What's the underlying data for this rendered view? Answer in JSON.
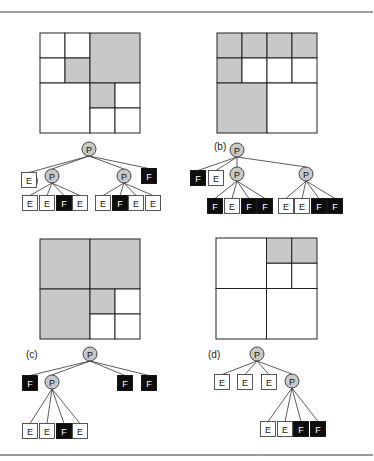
{
  "figure": {
    "rules": [
      {
        "x1": 0,
        "y1": 12,
        "x2": 373,
        "y2": 12
      },
      {
        "x1": 0,
        "y1": 455,
        "x2": 373,
        "y2": 455
      }
    ],
    "colors": {
      "gray_fill": "#c8c8c8",
      "full_fill": "#0d0d0d",
      "empty_fill": "#ffffff",
      "line": "#222222"
    },
    "panels": [
      {
        "id": "a",
        "label": "(a)",
        "label_pos": [
          26,
          184
        ],
        "grid": {
          "x": 40,
          "y": 33,
          "size": 100
        },
        "cells": [
          {
            "x": 0,
            "y": 0,
            "s": 0.25,
            "fill": "empty"
          },
          {
            "x": 0.25,
            "y": 0,
            "s": 0.25,
            "fill": "empty"
          },
          {
            "x": 0,
            "y": 0.25,
            "s": 0.25,
            "fill": "empty"
          },
          {
            "x": 0.25,
            "y": 0.25,
            "s": 0.25,
            "fill": "full"
          },
          {
            "x": 0.5,
            "y": 0,
            "s": 0.5,
            "fill": "full"
          },
          {
            "x": 0,
            "y": 0.5,
            "s": 0.5,
            "fill": "empty"
          },
          {
            "x": 0.5,
            "y": 0.5,
            "s": 0.25,
            "fill": "full"
          },
          {
            "x": 0.75,
            "y": 0.5,
            "s": 0.25,
            "fill": "empty"
          },
          {
            "x": 0.5,
            "y": 0.75,
            "s": 0.25,
            "fill": "empty"
          },
          {
            "x": 0.75,
            "y": 0.75,
            "s": 0.25,
            "fill": "empty"
          }
        ],
        "tree": {
          "label": "P",
          "x": 89,
          "y": 149,
          "children": [
            {
              "label": "E",
              "x": 29,
              "y": 180
            },
            {
              "label": "P",
              "x": 52,
              "y": 176,
              "children": [
                {
                  "label": "E",
                  "x": 30,
                  "y": 203
                },
                {
                  "label": "E",
                  "x": 47,
                  "y": 203
                },
                {
                  "label": "F",
                  "x": 64,
                  "y": 203
                },
                {
                  "label": "E",
                  "x": 80,
                  "y": 203
                }
              ]
            },
            {
              "label": "P",
              "x": 124,
              "y": 176,
              "children": [
                {
                  "label": "E",
                  "x": 103,
                  "y": 203
                },
                {
                  "label": "F",
                  "x": 120,
                  "y": 203
                },
                {
                  "label": "E",
                  "x": 136,
                  "y": 203
                },
                {
                  "label": "E",
                  "x": 153,
                  "y": 203
                }
              ]
            },
            {
              "label": "F",
              "x": 149,
              "y": 176
            }
          ]
        }
      },
      {
        "id": "b",
        "label": "(b)",
        "label_pos": [
          214,
          150
        ],
        "grid": {
          "x": 217,
          "y": 33,
          "size": 100
        },
        "cells": [
          {
            "x": 0,
            "y": 0,
            "s": 0.25,
            "fill": "full"
          },
          {
            "x": 0.25,
            "y": 0,
            "s": 0.25,
            "fill": "full"
          },
          {
            "x": 0,
            "y": 0.25,
            "s": 0.25,
            "fill": "full"
          },
          {
            "x": 0.25,
            "y": 0.25,
            "s": 0.25,
            "fill": "empty"
          },
          {
            "x": 0.5,
            "y": 0,
            "s": 0.25,
            "fill": "full"
          },
          {
            "x": 0.75,
            "y": 0,
            "s": 0.25,
            "fill": "full"
          },
          {
            "x": 0.5,
            "y": 0.25,
            "s": 0.25,
            "fill": "empty"
          },
          {
            "x": 0.75,
            "y": 0.25,
            "s": 0.25,
            "fill": "empty"
          },
          {
            "x": 0,
            "y": 0.5,
            "s": 0.5,
            "fill": "full"
          },
          {
            "x": 0.5,
            "y": 0.5,
            "s": 0.5,
            "fill": "empty"
          }
        ],
        "tree": {
          "label": "P",
          "x": 237,
          "y": 150,
          "children": [
            {
              "label": "F",
              "x": 198,
              "y": 178
            },
            {
              "label": "E",
              "x": 216,
              "y": 178
            },
            {
              "label": "P",
              "x": 237,
              "y": 174,
              "children": [
                {
                  "label": "F",
                  "x": 215,
                  "y": 206
                },
                {
                  "label": "E",
                  "x": 232,
                  "y": 206
                },
                {
                  "label": "F",
                  "x": 249,
                  "y": 206
                },
                {
                  "label": "F",
                  "x": 265,
                  "y": 206
                }
              ]
            },
            {
              "label": "P",
              "x": 306,
              "y": 174,
              "children": [
                {
                  "label": "E",
                  "x": 286,
                  "y": 206
                },
                {
                  "label": "E",
                  "x": 302,
                  "y": 206
                },
                {
                  "label": "F",
                  "x": 319,
                  "y": 206
                },
                {
                  "label": "F",
                  "x": 335,
                  "y": 206
                }
              ]
            }
          ]
        }
      },
      {
        "id": "c",
        "label": "(c)",
        "label_pos": [
          26,
          358
        ],
        "grid": {
          "x": 40,
          "y": 239,
          "size": 100
        },
        "cells": [
          {
            "x": 0,
            "y": 0,
            "s": 0.5,
            "fill": "full"
          },
          {
            "x": 0.5,
            "y": 0,
            "s": 0.5,
            "fill": "full"
          },
          {
            "x": 0,
            "y": 0.5,
            "s": 0.5,
            "fill": "full"
          },
          {
            "x": 0.5,
            "y": 0.5,
            "s": 0.25,
            "fill": "full"
          },
          {
            "x": 0.75,
            "y": 0.5,
            "s": 0.25,
            "fill": "empty"
          },
          {
            "x": 0.5,
            "y": 0.75,
            "s": 0.25,
            "fill": "empty"
          },
          {
            "x": 0.75,
            "y": 0.75,
            "s": 0.25,
            "fill": "empty"
          }
        ],
        "tree": {
          "label": "P",
          "x": 90,
          "y": 354,
          "children": [
            {
              "label": "F",
              "x": 30,
              "y": 383
            },
            {
              "label": "P",
              "x": 52,
              "y": 382,
              "children": [
                {
                  "label": "E",
                  "x": 30,
                  "y": 431
                },
                {
                  "label": "E",
                  "x": 47,
                  "y": 431
                },
                {
                  "label": "F",
                  "x": 64,
                  "y": 431
                },
                {
                  "label": "E",
                  "x": 80,
                  "y": 431
                }
              ]
            },
            {
              "label": "F",
              "x": 125,
              "y": 383
            },
            {
              "label": "F",
              "x": 149,
              "y": 383
            }
          ]
        }
      },
      {
        "id": "d",
        "label": "(d)",
        "label_pos": [
          208,
          358
        ],
        "grid": {
          "x": 216,
          "y": 238,
          "size": 101
        },
        "cells": [
          {
            "x": 0,
            "y": 0,
            "s": 0.5,
            "fill": "empty"
          },
          {
            "x": 0.5,
            "y": 0,
            "s": 0.25,
            "fill": "full"
          },
          {
            "x": 0.75,
            "y": 0,
            "s": 0.25,
            "fill": "full"
          },
          {
            "x": 0.5,
            "y": 0.25,
            "s": 0.25,
            "fill": "empty"
          },
          {
            "x": 0.75,
            "y": 0.25,
            "s": 0.25,
            "fill": "empty"
          },
          {
            "x": 0,
            "y": 0.5,
            "s": 0.5,
            "fill": "empty"
          },
          {
            "x": 0.5,
            "y": 0.5,
            "s": 0.5,
            "fill": "empty"
          }
        ],
        "tree": {
          "label": "P",
          "x": 257,
          "y": 354,
          "children": [
            {
              "label": "E",
              "x": 222,
              "y": 382
            },
            {
              "label": "E",
              "x": 245,
              "y": 382
            },
            {
              "label": "E",
              "x": 269,
              "y": 382
            },
            {
              "label": "P",
              "x": 292,
              "y": 381,
              "children": [
                {
                  "label": "E",
                  "x": 268,
                  "y": 429
                },
                {
                  "label": "E",
                  "x": 285,
                  "y": 429
                },
                {
                  "label": "F",
                  "x": 301,
                  "y": 429
                },
                {
                  "label": "F",
                  "x": 318,
                  "y": 429
                }
              ]
            }
          ]
        }
      }
    ]
  }
}
